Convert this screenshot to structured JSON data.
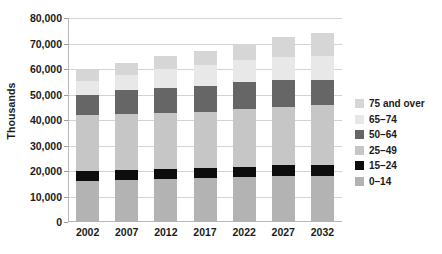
{
  "chart_data": {
    "type": "bar",
    "stacked": true,
    "title": "",
    "subtitle": "",
    "xlabel": "",
    "ylabel": "Thousands",
    "categories": [
      "2002",
      "2007",
      "2012",
      "2017",
      "2022",
      "2027",
      "2032"
    ],
    "ylim": [
      0,
      80000
    ],
    "ytick_values": [
      0,
      10000,
      20000,
      30000,
      40000,
      50000,
      60000,
      70000,
      80000
    ],
    "ytick_labels": [
      "0",
      "10,000",
      "20,000",
      "30,000",
      "40,000",
      "50,000",
      "60,000",
      "70,000",
      "80,000"
    ],
    "grid": true,
    "legend_position": "right",
    "series": [
      {
        "name": "0–14",
        "color": "#b3b3b3",
        "values": [
          16000,
          16300,
          16700,
          17200,
          17600,
          17900,
          18100
        ]
      },
      {
        "name": "15–24",
        "color": "#0d0d0d",
        "values": [
          4000,
          4100,
          4100,
          4000,
          4100,
          4300,
          4400
        ]
      },
      {
        "name": "25–49",
        "color": "#c6c6c6",
        "values": [
          22000,
          22100,
          22000,
          22000,
          22500,
          23000,
          23300
        ]
      },
      {
        "name": "50–64",
        "color": "#666666",
        "values": [
          8000,
          9200,
          9900,
          10100,
          10600,
          10500,
          9900
        ]
      },
      {
        "name": "65–74",
        "color": "#e8e8e8",
        "values": [
          5400,
          6000,
          7200,
          8400,
          8900,
          9200,
          9500
        ]
      },
      {
        "name": "75 and over",
        "color": "#d6d6d6",
        "values": [
          4600,
          4800,
          5100,
          5300,
          6300,
          7600,
          8800
        ]
      }
    ],
    "totals": [
      60000,
      62500,
      65000,
      67000,
      70000,
      72500,
      74000
    ],
    "legend": [
      {
        "label": "75 and over",
        "color": "#d6d6d6"
      },
      {
        "label": "65–74",
        "color": "#e8e8e8"
      },
      {
        "label": "50–64",
        "color": "#666666"
      },
      {
        "label": "25–49",
        "color": "#c6c6c6"
      },
      {
        "label": "15–24",
        "color": "#0d0d0d"
      },
      {
        "label": "0–14",
        "color": "#b3b3b3"
      }
    ]
  }
}
